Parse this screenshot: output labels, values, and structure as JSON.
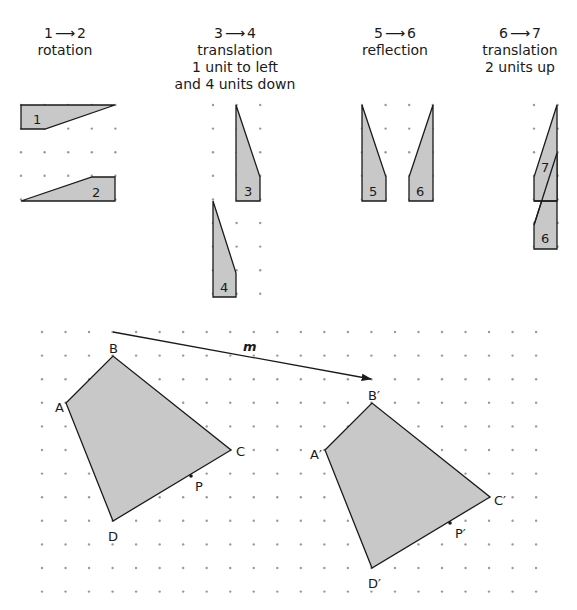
{
  "colors": {
    "fill": "#c8c8c8",
    "stroke": "#1a1a1a",
    "dot": "#9a9a9a"
  },
  "transformations": [
    {
      "from": "1",
      "to": "2",
      "arrow": "→",
      "line1": "rotation",
      "line2": "",
      "line3": ""
    },
    {
      "from": "3",
      "to": "4",
      "arrow": "→",
      "line1": "translation",
      "line2": "1 unit to left",
      "line3": "and 4 units down"
    },
    {
      "from": "5",
      "to": "6",
      "arrow": "→",
      "line1": "reflection",
      "line2": "",
      "line3": ""
    },
    {
      "from": "6",
      "to": "7",
      "arrow": "→",
      "line1": "translation",
      "line2": "2 units up",
      "line3": ""
    }
  ],
  "shape_labels": {
    "s1": "1",
    "s2": "2",
    "s3": "3",
    "s4": "4",
    "s5": "5",
    "s6a": "6",
    "s6b": "6",
    "s7": "7"
  },
  "bottom": {
    "vector_label": "m",
    "original": {
      "A": "A",
      "B": "B",
      "C": "C",
      "D": "D",
      "P": "P"
    },
    "image": {
      "A": "A′",
      "B": "B′",
      "C": "C′",
      "D": "D′",
      "P": "P′"
    }
  }
}
